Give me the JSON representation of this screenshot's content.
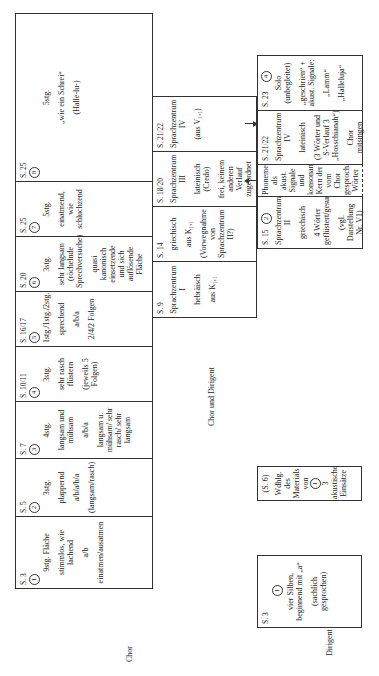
{
  "row_labels": {
    "chor": "Chor",
    "chor_und_dirigent": "Chor und Dirigent",
    "dirigent": "Dirigent"
  },
  "chor_cells": [
    {
      "ref": "S. 3",
      "num": "1",
      "lines": [
        "9stg. Fläche",
        "stimmlos, wie lachend",
        "a/b",
        "einatmen/ausatmen"
      ]
    },
    {
      "ref": "S. 5",
      "num": "2",
      "lines": [
        "3stg.",
        "plappernd",
        "a/b/a/b/a",
        "(langsam/rasch)"
      ]
    },
    {
      "ref": "S. 7",
      "num": "3",
      "lines": [
        "4stg.",
        "langsam und mühsam",
        "a/b/a",
        "langsam u. mühsam/ sehr rasch/ sehr langsam"
      ]
    },
    {
      "ref": "S. 10/11",
      "num": "4",
      "lines": [
        "3stg.",
        "sehr rasch flüstern",
        "(jeweils 5 Folgen)"
      ]
    },
    {
      "ref": "S. 16/17",
      "num": "5",
      "lines": [
        "1stg./1stg./2stg.",
        "sprechend",
        "a/b/a",
        "2/4/2 Folgen"
      ]
    },
    {
      "ref": "S. 20",
      "num": "6",
      "lines": [
        "3stg.",
        "sehr langsam (röchelnde Sprechversuche)",
        "quasi kanonisch einsetzende und sich auflösende Fläche"
      ]
    },
    {
      "ref": "S. 25",
      "num": "7",
      "lines": [
        "5stg.",
        "einatmend, wie schluchzend"
      ]
    },
    {
      "ref": "S. 25",
      "num": "8",
      "lines": [
        "5stg.",
        "„wie ein Schrei“",
        "(Halle-lu-)"
      ]
    }
  ],
  "sprach_cells": [
    {
      "ref": "S. 9",
      "lines": [
        "Sprachzentrum I",
        "hebräisch",
        "aus K₁,₁"
      ]
    },
    {
      "ref": "S. 14",
      "lines": [
        "griechisch",
        "aus K₁,₁",
        "(Vorwegnahme von Sprachzentrum II?)"
      ]
    },
    {
      "ref": "S. 18/20",
      "lines": [
        "Sprachzentrum III",
        "lateinisch (Credo)",
        "frei, keinem anderen Verlauf zugeordnet"
      ]
    },
    {
      "ref": "S. 21/22",
      "lines": [
        "Sprachzentrum IV",
        "(aus V₁,₁)"
      ]
    }
  ],
  "right_cells": {
    "sz2": {
      "ref": "S. 15",
      "num": "2",
      "lines": [
        "Sprachzentrum II",
        "griechisch",
        "4 Wörter geflüstert/gesungen",
        "(vgl. Darstellung Nr. V1)"
      ]
    },
    "phoneme": {
      "lines": [
        "Phoneme als akust. Signale und konsonant. Kern der vom Chor gesproch. Wörter"
      ]
    },
    "sz4": {
      "ref": "S. 21/22",
      "lines": [
        "Sprachzentrum IV",
        "lateinisch",
        "(3 Wörter und S-Verlauf 3 „Hosschianah“)",
        "Chor mitsingen"
      ]
    },
    "solo": {
      "ref": "S. 23",
      "num": "4",
      "lines": [
        "Solo (unbegleitet)",
        "„geschrien“ + akust. Signale:",
        "„Lamm“",
        "„Halleluja“"
      ]
    }
  },
  "s6_box": {
    "ref": "(S. 6)",
    "lines": [
      "Wdhlg. des Materials von",
      "1",
      "3 akustische Einsätze"
    ]
  },
  "dirigent_box": {
    "ref": "S. 3",
    "num": "1",
    "lines": [
      "vier Silben, beginnend mit „a“",
      "(sachlich gesprochen)"
    ]
  }
}
